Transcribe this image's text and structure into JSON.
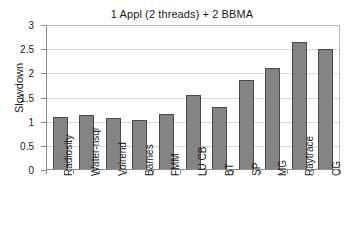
{
  "chart_data": {
    "type": "bar",
    "title": "1 Appl (2 threads) + 2 BBMA",
    "xlabel": "",
    "ylabel": "Slowdown",
    "ylim": [
      0,
      3
    ],
    "yticks": [
      "0",
      "0.5",
      "1",
      "1.5",
      "2",
      "2.5",
      "3"
    ],
    "ytick_values": [
      0,
      0.5,
      1,
      1.5,
      2,
      2.5,
      3
    ],
    "grid": "horizontal",
    "legend": "none",
    "bar_color": "#848484",
    "bar_border_color": "#4a4a4a",
    "gridline_color": "#d8d8d8",
    "axis_color": "#8c8c8c",
    "background": "#ffffff",
    "categories": [
      "Radiosity",
      "Water-nsqr",
      "Volrend",
      "Barnes",
      "FMM",
      "LU CB",
      "BT",
      "SP",
      "MG",
      "Raytrace",
      "CG"
    ],
    "values": [
      1.08,
      1.12,
      1.05,
      1.01,
      1.13,
      1.53,
      1.29,
      1.84,
      2.1,
      2.62,
      2.49
    ]
  }
}
